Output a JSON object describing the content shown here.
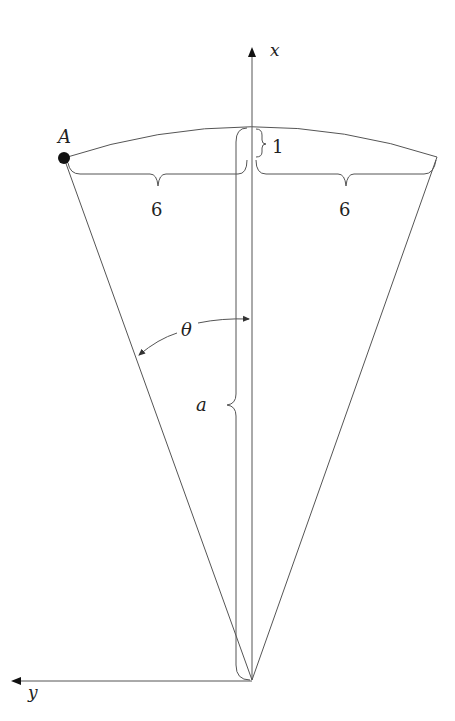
{
  "diagram": {
    "axes": {
      "x_label": "x",
      "y_label": "y"
    },
    "point": {
      "label": "A"
    },
    "dimensions": {
      "left_half_chord": "6",
      "right_half_chord": "6",
      "sagitta": "1",
      "radius_minus_sagitta": "a"
    },
    "angle": {
      "label": "θ"
    },
    "colors": {
      "line": "#555555",
      "text": "#222222",
      "point": "#111111"
    }
  }
}
